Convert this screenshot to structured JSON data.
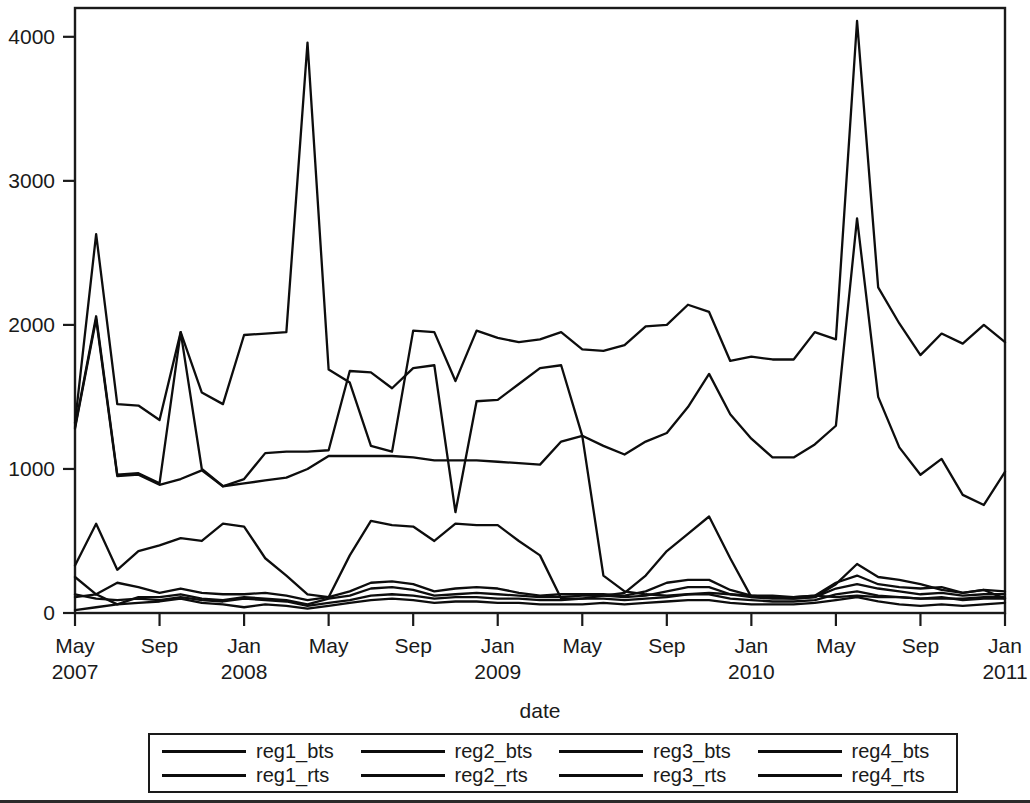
{
  "chart_data": {
    "type": "line",
    "title": "",
    "xlabel": "date",
    "ylabel": "",
    "ylim": [
      0,
      4200
    ],
    "yticks": [
      0,
      1000,
      2000,
      3000,
      4000
    ],
    "ytick_labels": [
      "0",
      "1000",
      "2000",
      "3000",
      "4000"
    ],
    "grid": false,
    "legend_position": "bottom",
    "x_axis_type": "monthly date axis",
    "x_start": "2007-05",
    "x_end": "2011-01",
    "n_points": 45,
    "xticks": [
      {
        "label_month": "May",
        "label_year": "2007",
        "index": 0
      },
      {
        "label_month": "Sep",
        "label_year": "",
        "index": 4
      },
      {
        "label_month": "Jan",
        "label_year": "2008",
        "index": 8
      },
      {
        "label_month": "May",
        "label_year": "",
        "index": 12
      },
      {
        "label_month": "Sep",
        "label_year": "",
        "index": 16
      },
      {
        "label_month": "Jan",
        "label_year": "2009",
        "index": 20
      },
      {
        "label_month": "May",
        "label_year": "",
        "index": 24
      },
      {
        "label_month": "Sep",
        "label_year": "",
        "index": 28
      },
      {
        "label_month": "Jan",
        "label_year": "2010",
        "index": 32
      },
      {
        "label_month": "May",
        "label_year": "",
        "index": 36
      },
      {
        "label_month": "Sep",
        "label_year": "",
        "index": 40
      },
      {
        "label_month": "Jan",
        "label_year": "2011",
        "index": 44
      }
    ],
    "x": [
      "2007-05",
      "2007-06",
      "2007-07",
      "2007-08",
      "2007-09",
      "2007-10",
      "2007-11",
      "2007-12",
      "2008-01",
      "2008-02",
      "2008-03",
      "2008-04",
      "2008-05",
      "2008-06",
      "2008-07",
      "2008-08",
      "2008-09",
      "2008-10",
      "2008-11",
      "2008-12",
      "2009-01",
      "2009-02",
      "2009-03",
      "2009-04",
      "2009-05",
      "2009-06",
      "2009-07",
      "2009-08",
      "2009-09",
      "2009-10",
      "2009-11",
      "2009-12",
      "2010-01",
      "2010-02",
      "2010-03",
      "2010-04",
      "2010-05",
      "2010-06",
      "2010-07",
      "2010-08",
      "2010-09",
      "2010-10",
      "2010-11",
      "2010-12",
      "2011-01"
    ],
    "series": [
      {
        "name": "reg1_bts",
        "values": [
          1320,
          2630,
          1450,
          1440,
          1340,
          1950,
          1530,
          1450,
          1930,
          1940,
          1950,
          3960,
          1690,
          1600,
          1160,
          1120,
          1960,
          1950,
          1610,
          1960,
          1910,
          1880,
          1900,
          1950,
          1830,
          1820,
          1860,
          1990,
          2000,
          2140,
          2090,
          1750,
          1780,
          1760,
          1760,
          1950,
          1900,
          4110,
          2260,
          2010,
          1790,
          1940,
          1870,
          2000,
          1880
        ]
      },
      {
        "name": "reg2_bts",
        "values": [
          1290,
          2060,
          960,
          970,
          900,
          1950,
          1000,
          880,
          930,
          1110,
          1120,
          1120,
          1130,
          1680,
          1670,
          1560,
          1700,
          1720,
          700,
          1470,
          1480,
          1590,
          1700,
          1720,
          1230,
          1160,
          1100,
          1190,
          1250,
          1430,
          1660,
          1380,
          1210,
          1080,
          1080,
          1170,
          1300,
          2740,
          1500,
          1150,
          960,
          1070,
          820,
          750,
          980
        ]
      },
      {
        "name": "reg3_bts",
        "values": [
          1280,
          2040,
          950,
          960,
          890,
          930,
          990,
          880,
          900,
          920,
          940,
          1000,
          1090,
          1090,
          1090,
          1090,
          1080,
          1060,
          1060,
          1060,
          1050,
          1040,
          1030,
          1190,
          1230,
          260,
          150,
          130,
          120,
          130,
          140,
          130,
          120,
          120,
          110,
          120,
          110,
          120,
          110,
          110,
          100,
          100,
          100,
          110,
          110
        ]
      },
      {
        "name": "reg4_bts",
        "values": [
          330,
          620,
          300,
          430,
          470,
          520,
          500,
          620,
          600,
          380,
          260,
          130,
          110,
          400,
          640,
          610,
          600,
          500,
          620,
          610,
          610,
          500,
          400,
          100,
          100,
          120,
          140,
          260,
          430,
          550,
          670,
          380,
          110,
          110,
          100,
          110,
          200,
          340,
          250,
          230,
          200,
          160,
          140,
          160,
          100
        ]
      },
      {
        "name": "reg1_rts",
        "values": [
          250,
          130,
          210,
          180,
          140,
          170,
          140,
          130,
          130,
          140,
          120,
          90,
          110,
          150,
          210,
          220,
          200,
          150,
          170,
          180,
          170,
          140,
          120,
          130,
          130,
          130,
          120,
          150,
          210,
          230,
          230,
          160,
          120,
          110,
          110,
          120,
          210,
          260,
          200,
          180,
          170,
          180,
          140,
          160,
          150
        ]
      },
      {
        "name": "reg2_rts",
        "values": [
          110,
          130,
          60,
          110,
          110,
          130,
          100,
          90,
          110,
          100,
          90,
          60,
          100,
          120,
          170,
          180,
          160,
          120,
          130,
          140,
          130,
          120,
          110,
          110,
          120,
          120,
          110,
          120,
          150,
          180,
          180,
          130,
          110,
          100,
          100,
          110,
          170,
          200,
          170,
          150,
          130,
          140,
          120,
          130,
          130
        ]
      },
      {
        "name": "reg3_rts",
        "values": [
          130,
          100,
          90,
          100,
          90,
          110,
          90,
          80,
          100,
          90,
          80,
          50,
          70,
          90,
          120,
          130,
          120,
          100,
          110,
          110,
          100,
          100,
          90,
          90,
          100,
          100,
          90,
          100,
          110,
          130,
          130,
          100,
          90,
          80,
          80,
          90,
          130,
          150,
          120,
          110,
          100,
          110,
          90,
          100,
          100
        ]
      },
      {
        "name": "reg4_rts",
        "values": [
          20,
          40,
          60,
          70,
          80,
          100,
          70,
          60,
          40,
          60,
          50,
          30,
          50,
          70,
          90,
          100,
          90,
          70,
          80,
          80,
          70,
          70,
          60,
          60,
          60,
          70,
          60,
          70,
          80,
          90,
          90,
          70,
          60,
          60,
          60,
          70,
          90,
          110,
          80,
          60,
          50,
          60,
          50,
          60,
          70
        ]
      }
    ]
  },
  "axis": {
    "x_title": "date",
    "ytick_labels": [
      "4000",
      "3000",
      "2000",
      "1000",
      "0"
    ]
  },
  "legend": {
    "rows": [
      [
        {
          "label": "reg1_bts"
        },
        {
          "label": "reg2_bts"
        },
        {
          "label": "reg3_bts"
        },
        {
          "label": "reg4_bts"
        }
      ],
      [
        {
          "label": "reg1_rts"
        },
        {
          "label": "reg2_rts"
        },
        {
          "label": "reg3_rts"
        },
        {
          "label": "reg4_rts"
        }
      ]
    ]
  },
  "colors": {
    "line": "#0d0d0d",
    "axis": "#1a1a1a",
    "background": "#ffffff"
  }
}
